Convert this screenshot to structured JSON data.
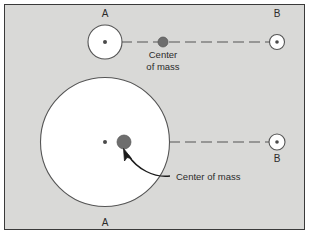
{
  "figure": {
    "background_color": "#d9d9d7",
    "frame_color": "#3a3a3a",
    "outline_color": "#555555",
    "body_fill": "#ffffff",
    "com_color": "#6e6e6e",
    "line_color": "#555555",
    "text_color": "#2b2b2b"
  },
  "top_system": {
    "body_a": {
      "label": "A",
      "cx": 105,
      "cy": 42,
      "r": 17,
      "center_dot_r": 2,
      "label_x": 105,
      "label_y": 17
    },
    "body_b": {
      "label": "B",
      "cx": 277,
      "cy": 42,
      "r": 7.5,
      "center_dot_r": 1.8,
      "label_x": 277,
      "label_y": 17
    },
    "center_of_mass": {
      "label_line1": "Center",
      "label_line2": "of mass",
      "cx": 163,
      "cy": 42,
      "r": 5,
      "label_x": 163,
      "label_y": 58
    },
    "connector": {
      "x1": 105,
      "x2": 277,
      "y": 42,
      "dash": "11 5"
    }
  },
  "bottom_system": {
    "body_a": {
      "label": "A",
      "cx": 105,
      "cy": 142,
      "r": 64.5,
      "center_dot_r": 2,
      "label_x": 105,
      "label_y": 224
    },
    "body_b": {
      "label": "B",
      "cx": 277,
      "cy": 142,
      "r": 8,
      "center_dot_r": 1.8,
      "label_x": 277,
      "label_y": 161
    },
    "center_of_mass": {
      "label": "Center of mass",
      "cx": 124,
      "cy": 142,
      "r": 7,
      "label_x": 176,
      "label_y": 180
    },
    "connector": {
      "x1": 105,
      "x2": 277,
      "y": 142,
      "dash": "11 5"
    },
    "pointer_arrow": {
      "path": "M 170 175 C 155 177 138 168 128 154",
      "tip_x": 124,
      "tip_y": 149
    }
  }
}
